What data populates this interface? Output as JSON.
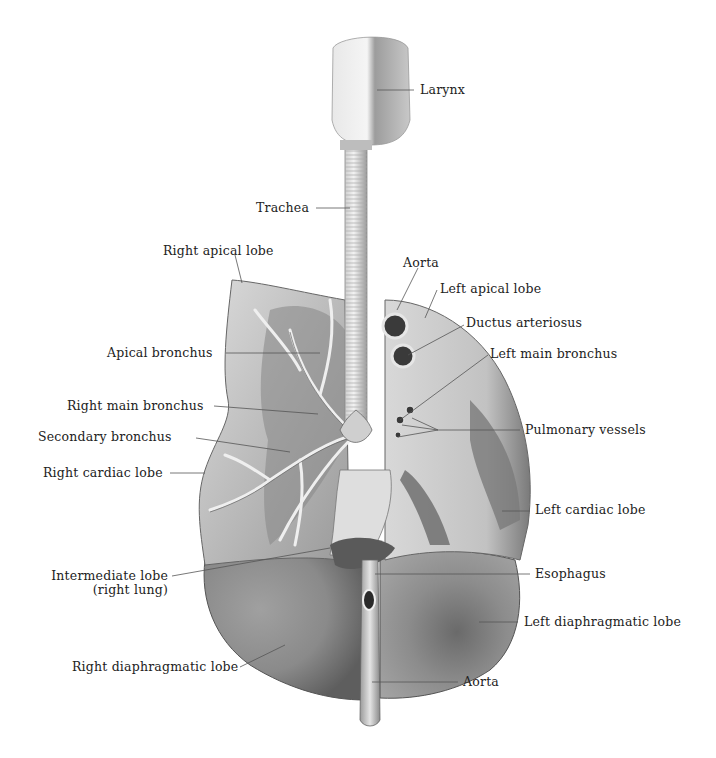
{
  "figure": {
    "colors": {
      "background": "#ffffff",
      "label_text": "#222222",
      "leader_line": "#555555",
      "lung_light": "#d9d9d9",
      "lung_mid": "#a8a8a8",
      "lung_dark": "#6e6e6e",
      "trachea": "#e6e6e6"
    }
  },
  "labels": {
    "larynx": "Larynx",
    "trachea": "Trachea",
    "right_apical_lobe": "Right apical lobe",
    "aorta_top": "Aorta",
    "left_apical_lobe": "Left apical lobe",
    "ductus_arteriosus": "Ductus arteriosus",
    "apical_bronchus": "Apical bronchus",
    "left_main_bronchus": "Left main bronchus",
    "right_main_bronchus": "Right main bronchus",
    "secondary_bronchus": "Secondary bronchus",
    "pulmonary_vessels": "Pulmonary vessels",
    "right_cardiac_lobe": "Right cardiac lobe",
    "left_cardiac_lobe": "Left cardiac lobe",
    "intermediate_lobe_line1": "Intermediate lobe",
    "intermediate_lobe_line2": "(right lung)",
    "esophagus": "Esophagus",
    "left_diaphragmatic_lobe": "Left diaphragmatic lobe",
    "right_diaphragmatic_lobe": "Right diaphragmatic lobe",
    "aorta_bottom": "Aorta"
  }
}
